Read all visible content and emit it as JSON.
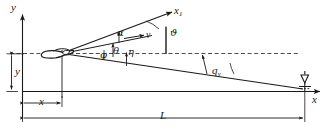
{
  "figure": {
    "kind": "engineering-geometry-diagram",
    "title": "",
    "background_color": "#ffffff",
    "line_color": "#1a1a1a",
    "dash_color": "#555555"
  },
  "axes": {
    "y_axis_label": "y",
    "x_axis_label": "x",
    "origin_note": ""
  },
  "body_axis": {
    "label": "x",
    "subscript": "1"
  },
  "vectors": {
    "velocity_label": "v"
  },
  "angles": [
    {
      "name": "alpha",
      "label": "α",
      "meaning": "angle-of-attack"
    },
    {
      "name": "vartheta",
      "label": "ϑ",
      "meaning": "pitch-angle"
    },
    {
      "name": "varphi",
      "label": "φ",
      "meaning": "line-of-sight-angle"
    },
    {
      "name": "theta",
      "label": "θ",
      "meaning": "flight-path-angle"
    },
    {
      "name": "eta",
      "label": "η",
      "meaning": "lead-angle"
    }
  ],
  "station_angle": {
    "label": "q",
    "subscript": "v"
  },
  "dimensions": [
    {
      "name": "height",
      "label": "y"
    },
    {
      "name": "horizontal-offset",
      "label": "x"
    },
    {
      "name": "total-range",
      "label": "L"
    }
  ],
  "symbols": {
    "aircraft": "aircraft-silhouette",
    "ground_station": "ground-station-antenna"
  }
}
